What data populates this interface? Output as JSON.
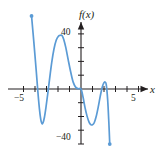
{
  "figure": {
    "name": "polynomial-graph",
    "background_color": "#ffffff",
    "axis_color": "#231f20",
    "curve_color": "#5b9bd5"
  },
  "labels": {
    "y_axis_title": "f(x)",
    "x_axis_title": "x",
    "y_tick_positive": "40",
    "y_tick_negative": "−40",
    "x_tick_negative": "−5",
    "x_tick_positive": "5"
  },
  "chart_data": {
    "type": "line",
    "title": "",
    "xlabel": "x",
    "ylabel": "f(x)",
    "xlim": [
      -5.8,
      6.2
    ],
    "ylim": [
      -53,
      58
    ],
    "grid": false,
    "legend": null,
    "x_ticks": [
      -5,
      -4,
      -3,
      -2,
      -1,
      1,
      2,
      3,
      4,
      5
    ],
    "x_tick_labels": [
      "−5",
      "",
      "",
      "",
      "",
      "",
      "",
      "",
      "",
      "5"
    ],
    "y_ticks": [
      -40,
      -30,
      -20,
      -10,
      10,
      20,
      30,
      40
    ],
    "y_tick_labels": [
      "−40",
      "",
      "",
      "",
      "",
      "",
      "",
      "40"
    ],
    "series": [
      {
        "name": "f(x)",
        "color": "#5b9bd5",
        "start_marker": "dot",
        "end_marker": "dot",
        "x": [
          -4.3,
          -4.1,
          -3.9,
          -3.75,
          -3.62,
          -3.5,
          -3.4,
          -3.3,
          -3.18,
          -3.05,
          -2.9,
          -2.72,
          -2.55,
          -2.35,
          -2.15,
          -1.95,
          -1.78,
          -1.65,
          -1.5,
          -1.32,
          -1.12,
          -0.9,
          -0.68,
          -0.45,
          -0.22,
          0.0,
          0.18,
          0.35,
          0.52,
          0.7,
          0.85,
          1.0,
          1.15,
          1.32,
          1.5,
          1.68,
          1.85,
          2.0,
          2.1,
          2.2,
          2.32,
          2.42,
          2.5
        ],
        "y": [
          53.0,
          34.0,
          14.0,
          -2.0,
          -14.0,
          -22.0,
          -25.0,
          -24.5,
          -20.5,
          -13.5,
          -4.0,
          8.0,
          19.0,
          29.0,
          35.5,
          38.5,
          39.0,
          38.8,
          36.0,
          30.0,
          21.5,
          12.5,
          5.0,
          1.2,
          0.2,
          0.0,
          -6.0,
          -13.5,
          -19.5,
          -24.0,
          -25.8,
          -26.0,
          -24.5,
          -20.0,
          -13.0,
          -5.0,
          1.5,
          4.6,
          5.0,
          3.0,
          -8.0,
          -24.0,
          -40.0
        ]
      }
    ],
    "features": {
      "local_minima": [
        [
          -3.4,
          -25
        ],
        [
          1.0,
          -26
        ]
      ],
      "local_maxima": [
        [
          -1.7,
          39
        ],
        [
          2.1,
          5
        ]
      ],
      "x_intercepts": [
        -3.8,
        -2.85,
        0.0,
        1.82,
        2.28
      ],
      "y_intercept": 0
    }
  }
}
